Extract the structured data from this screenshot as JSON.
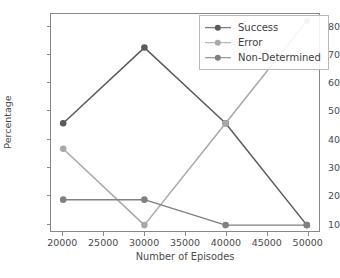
{
  "chart_data": {
    "type": "line",
    "title": "",
    "xlabel": "Number of Episodes",
    "ylabel": "Percentage",
    "x": [
      20000,
      30000,
      40000,
      50000
    ],
    "xlim": [
      18500,
      51500
    ],
    "ylim": [
      7.0,
      84.5
    ],
    "xticks": [
      20000,
      25000,
      30000,
      35000,
      40000,
      45000,
      50000
    ],
    "xtick_labels": [
      "20000",
      "25000",
      "30000",
      "35000",
      "40000",
      "45000",
      "50000"
    ],
    "yticks": [
      10,
      20,
      30,
      40,
      50,
      60,
      70,
      80
    ],
    "ytick_labels": [
      "10",
      "20",
      "30",
      "40",
      "50",
      "60",
      "70",
      "80"
    ],
    "grid": false,
    "legend_position": "upper right",
    "marker": "circle",
    "series": [
      {
        "name": "Success",
        "color": "#5a5a5a",
        "values": [
          45.5,
          72.5,
          45.5,
          9.1
        ]
      },
      {
        "name": "Error",
        "color": "#a8a8a8",
        "values": [
          36.4,
          9.1,
          45.5,
          82.0
        ]
      },
      {
        "name": "Non-Determined",
        "color": "#808080",
        "values": [
          18.2,
          18.2,
          9.1,
          9.1
        ]
      }
    ]
  },
  "axes": {
    "spine_color": "#888888",
    "tick_color": "#4a4a4a",
    "background": "#ffffff"
  }
}
